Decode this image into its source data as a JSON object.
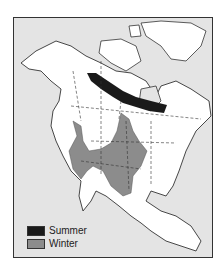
{
  "map": {
    "region": "North America",
    "colors": {
      "ocean": "#e4e4e4",
      "land": "#ffffff",
      "summer": "#1a1a1a",
      "winter": "#8c8c8c",
      "border": "#333333"
    }
  },
  "legend": {
    "items": [
      {
        "label": "Summer",
        "color": "#1a1a1a"
      },
      {
        "label": "Winter",
        "color": "#8c8c8c"
      }
    ]
  }
}
